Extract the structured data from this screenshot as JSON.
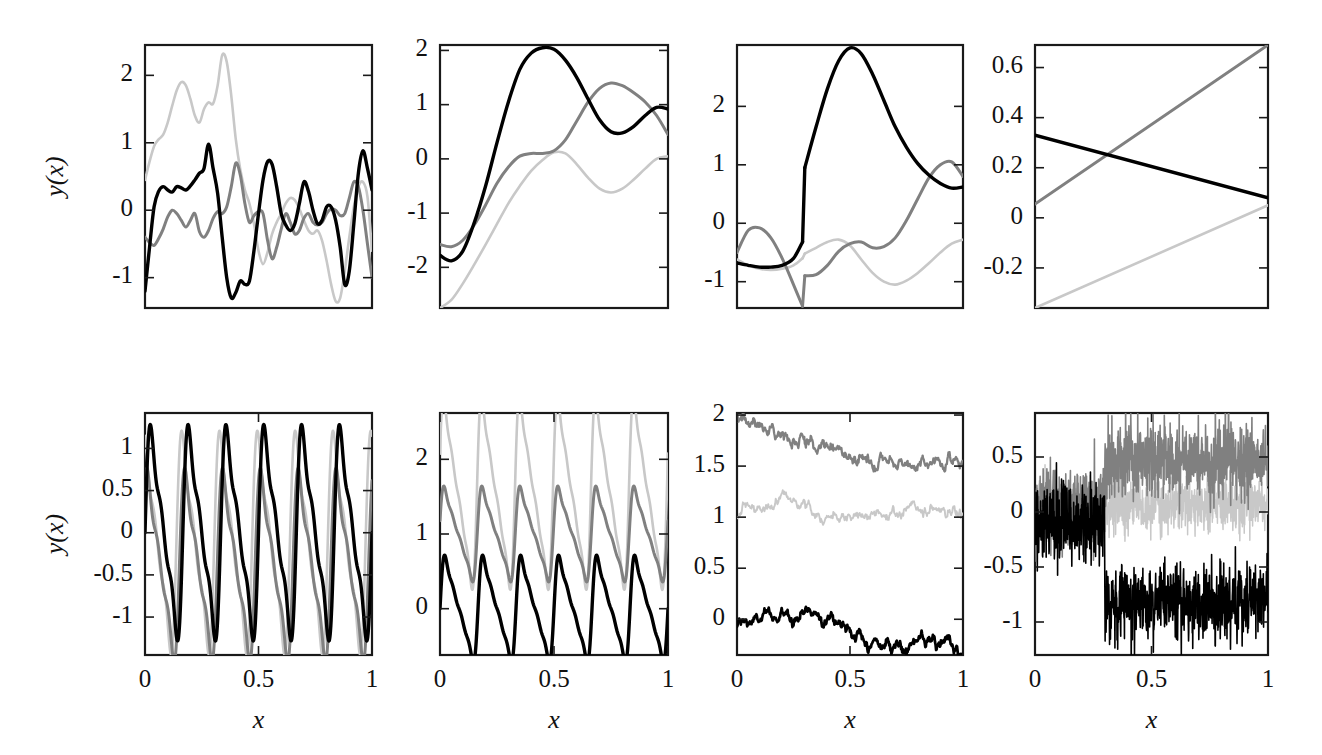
{
  "figure": {
    "width": 1322,
    "height": 755,
    "background": "#ffffff",
    "rows": 2,
    "cols": 4,
    "shared_ylabel": "y(x)",
    "shared_xlabel": "x"
  },
  "colors": {
    "series_1": "#000000",
    "series_2": "#808080",
    "series_3": "#c8c8c8",
    "frame": "#1a1a1a",
    "text": "#111111"
  },
  "chart_data": [
    {
      "id": "panel-1",
      "type": "line",
      "title": "",
      "xlabel": "",
      "ylabel": "y(x)",
      "xlim": [
        0,
        1
      ],
      "ylim": [
        -1.45,
        2.45
      ],
      "xticks": [],
      "xticklabels": [],
      "yticks": [
        -1,
        0,
        1,
        2
      ],
      "yticklabels": [
        "-1",
        "0",
        "1",
        "2"
      ],
      "grid": false,
      "legend": "none",
      "series": [
        {
          "name": "series_1",
          "color": "#000000",
          "x": [
            0.0,
            0.02,
            0.04,
            0.06,
            0.08,
            0.1,
            0.12,
            0.14,
            0.16,
            0.18,
            0.2,
            0.22,
            0.24,
            0.26,
            0.28,
            0.3,
            0.32,
            0.34,
            0.36,
            0.38,
            0.4,
            0.42,
            0.44,
            0.46,
            0.48,
            0.5,
            0.52,
            0.54,
            0.56,
            0.58,
            0.6,
            0.62,
            0.64,
            0.66,
            0.68,
            0.7,
            0.72,
            0.74,
            0.76,
            0.78,
            0.8,
            0.82,
            0.84,
            0.86,
            0.88,
            0.9,
            0.92,
            0.94,
            0.96,
            0.98,
            1.0
          ],
          "y": [
            -1.2,
            -0.55,
            0.05,
            0.28,
            0.35,
            0.3,
            0.27,
            0.35,
            0.33,
            0.3,
            0.36,
            0.45,
            0.55,
            0.62,
            0.98,
            0.62,
            0.25,
            -0.4,
            -1.0,
            -1.3,
            -1.22,
            -1.05,
            -1.1,
            -1.05,
            -0.6,
            -0.05,
            0.45,
            0.72,
            0.68,
            0.35,
            -0.05,
            -0.22,
            -0.3,
            -0.2,
            0.1,
            0.42,
            0.28,
            0.0,
            -0.2,
            -0.15,
            0.05,
            0.05,
            -0.15,
            -0.55,
            -1.1,
            -0.9,
            -0.2,
            0.55,
            0.88,
            0.62,
            0.3
          ]
        },
        {
          "name": "series_2",
          "color": "#808080",
          "x": [
            0.0,
            0.02,
            0.04,
            0.06,
            0.08,
            0.1,
            0.12,
            0.14,
            0.16,
            0.18,
            0.2,
            0.22,
            0.24,
            0.26,
            0.28,
            0.3,
            0.32,
            0.34,
            0.36,
            0.38,
            0.4,
            0.42,
            0.44,
            0.46,
            0.48,
            0.5,
            0.52,
            0.54,
            0.56,
            0.58,
            0.6,
            0.62,
            0.64,
            0.66,
            0.68,
            0.7,
            0.72,
            0.74,
            0.76,
            0.78,
            0.8,
            0.82,
            0.84,
            0.86,
            0.88,
            0.9,
            0.92,
            0.94,
            0.96,
            0.98,
            1.0
          ],
          "y": [
            -0.4,
            -0.48,
            -0.52,
            -0.42,
            -0.28,
            -0.1,
            0.0,
            -0.05,
            -0.15,
            -0.25,
            -0.15,
            -0.05,
            -0.32,
            -0.4,
            -0.3,
            -0.12,
            -0.02,
            -0.05,
            0.05,
            0.35,
            0.7,
            0.52,
            0.1,
            -0.18,
            -0.08,
            -0.02,
            -0.05,
            -0.45,
            -0.72,
            -0.55,
            -0.28,
            -0.05,
            -0.18,
            -0.35,
            -0.3,
            -0.12,
            -0.05,
            -0.18,
            -0.22,
            -0.18,
            -0.05,
            0.02,
            0.0,
            -0.08,
            -0.05,
            0.18,
            0.42,
            0.35,
            0.0,
            -0.5,
            -1.0
          ]
        },
        {
          "name": "series_3",
          "color": "#c8c8c8",
          "x": [
            0.0,
            0.02,
            0.04,
            0.06,
            0.08,
            0.1,
            0.12,
            0.14,
            0.16,
            0.18,
            0.2,
            0.22,
            0.24,
            0.26,
            0.28,
            0.3,
            0.32,
            0.34,
            0.36,
            0.38,
            0.4,
            0.42,
            0.44,
            0.46,
            0.48,
            0.5,
            0.52,
            0.54,
            0.56,
            0.58,
            0.6,
            0.62,
            0.64,
            0.66,
            0.68,
            0.7,
            0.72,
            0.74,
            0.76,
            0.78,
            0.8,
            0.82,
            0.84,
            0.86,
            0.88,
            0.9,
            0.92,
            0.94,
            0.96,
            0.98,
            1.0
          ],
          "y": [
            0.45,
            0.72,
            0.95,
            1.05,
            1.12,
            1.3,
            1.55,
            1.78,
            1.9,
            1.85,
            1.65,
            1.4,
            1.3,
            1.5,
            1.6,
            1.58,
            1.85,
            2.3,
            2.2,
            1.7,
            1.05,
            0.6,
            0.3,
            0.1,
            -0.2,
            -0.6,
            -0.8,
            -0.62,
            -0.35,
            -0.18,
            -0.05,
            0.1,
            0.18,
            0.15,
            0.02,
            -0.15,
            -0.3,
            -0.35,
            -0.3,
            -0.45,
            -0.75,
            -1.1,
            -1.35,
            -1.3,
            -0.9,
            -0.4,
            0.05,
            0.35,
            0.42,
            0.2,
            -0.6
          ]
        }
      ]
    },
    {
      "id": "panel-2",
      "type": "line",
      "title": "",
      "xlabel": "",
      "ylabel": "",
      "xlim": [
        0,
        1
      ],
      "ylim": [
        -2.75,
        2.1
      ],
      "xticks": [],
      "xticklabels": [],
      "yticks": [
        -2,
        -1,
        0,
        1,
        2
      ],
      "yticklabels": [
        "-2",
        "-1",
        "0",
        "1",
        "2"
      ],
      "grid": false,
      "legend": "none",
      "series": [
        {
          "name": "series_1",
          "color": "#000000",
          "x": [
            0.0,
            0.05,
            0.1,
            0.15,
            0.2,
            0.25,
            0.3,
            0.35,
            0.4,
            0.45,
            0.5,
            0.55,
            0.6,
            0.65,
            0.7,
            0.75,
            0.8,
            0.85,
            0.9,
            0.95,
            1.0
          ],
          "y": [
            -1.78,
            -1.88,
            -1.7,
            -1.18,
            -0.5,
            0.3,
            1.05,
            1.65,
            1.95,
            2.05,
            2.02,
            1.82,
            1.5,
            1.1,
            0.72,
            0.5,
            0.48,
            0.6,
            0.8,
            0.95,
            0.92
          ]
        },
        {
          "name": "series_2",
          "color": "#808080",
          "x": [
            0.0,
            0.05,
            0.1,
            0.15,
            0.2,
            0.25,
            0.3,
            0.35,
            0.4,
            0.45,
            0.5,
            0.55,
            0.6,
            0.65,
            0.7,
            0.75,
            0.8,
            0.85,
            0.9,
            0.95,
            1.0
          ],
          "y": [
            -1.58,
            -1.62,
            -1.5,
            -1.22,
            -0.85,
            -0.45,
            -0.15,
            0.05,
            0.1,
            0.1,
            0.15,
            0.35,
            0.7,
            1.05,
            1.3,
            1.4,
            1.35,
            1.22,
            1.05,
            0.8,
            0.45
          ]
        },
        {
          "name": "series_3",
          "color": "#c8c8c8",
          "x": [
            0.0,
            0.05,
            0.1,
            0.15,
            0.2,
            0.25,
            0.3,
            0.35,
            0.4,
            0.45,
            0.5,
            0.55,
            0.6,
            0.65,
            0.7,
            0.75,
            0.8,
            0.85,
            0.9,
            0.95,
            1.0
          ],
          "y": [
            -2.75,
            -2.6,
            -2.3,
            -1.95,
            -1.58,
            -1.2,
            -0.82,
            -0.5,
            -0.22,
            -0.02,
            0.12,
            0.1,
            -0.1,
            -0.35,
            -0.55,
            -0.62,
            -0.55,
            -0.38,
            -0.18,
            0.0,
            0.05
          ]
        }
      ]
    },
    {
      "id": "panel-3",
      "type": "line",
      "title": "",
      "xlabel": "",
      "ylabel": "",
      "xlim": [
        0,
        1
      ],
      "ylim": [
        -1.45,
        3.05
      ],
      "xticks": [],
      "xticklabels": [],
      "yticks": [
        -1,
        0,
        1,
        2
      ],
      "yticklabels": [
        "-1",
        "0",
        "1",
        "2"
      ],
      "grid": false,
      "legend": "none",
      "discontinuity_x": 0.3,
      "series": [
        {
          "name": "series_1",
          "color": "#000000",
          "x": [
            0.0,
            0.05,
            0.1,
            0.15,
            0.2,
            0.25,
            0.29,
            0.3,
            0.35,
            0.4,
            0.45,
            0.5,
            0.55,
            0.6,
            0.65,
            0.7,
            0.75,
            0.8,
            0.85,
            0.9,
            0.95,
            1.0
          ],
          "y": [
            -0.68,
            -0.72,
            -0.75,
            -0.75,
            -0.72,
            -0.6,
            -0.32,
            0.95,
            1.65,
            2.3,
            2.78,
            3.0,
            2.9,
            2.55,
            2.1,
            1.65,
            1.3,
            1.02,
            0.82,
            0.68,
            0.6,
            0.62
          ]
        },
        {
          "name": "series_2",
          "color": "#808080",
          "x": [
            0.0,
            0.05,
            0.1,
            0.15,
            0.2,
            0.25,
            0.29,
            0.3,
            0.35,
            0.4,
            0.45,
            0.5,
            0.55,
            0.6,
            0.65,
            0.7,
            0.75,
            0.8,
            0.85,
            0.9,
            0.95,
            1.0
          ],
          "y": [
            -0.5,
            -0.12,
            -0.08,
            -0.25,
            -0.6,
            -1.05,
            -1.42,
            -0.9,
            -0.88,
            -0.72,
            -0.48,
            -0.35,
            -0.32,
            -0.42,
            -0.4,
            -0.25,
            0.05,
            0.42,
            0.78,
            1.0,
            1.05,
            0.8
          ]
        },
        {
          "name": "series_3",
          "color": "#c8c8c8",
          "x": [
            0.0,
            0.05,
            0.1,
            0.15,
            0.2,
            0.25,
            0.29,
            0.3,
            0.35,
            0.4,
            0.45,
            0.5,
            0.55,
            0.6,
            0.65,
            0.7,
            0.75,
            0.8,
            0.85,
            0.9,
            0.95,
            1.0
          ],
          "y": [
            -0.62,
            -0.72,
            -0.78,
            -0.8,
            -0.78,
            -0.72,
            -0.6,
            -0.52,
            -0.42,
            -0.32,
            -0.28,
            -0.38,
            -0.62,
            -0.85,
            -1.0,
            -1.05,
            -0.98,
            -0.85,
            -0.68,
            -0.5,
            -0.35,
            -0.28
          ]
        }
      ]
    },
    {
      "id": "panel-4",
      "type": "line",
      "title": "",
      "xlabel": "",
      "ylabel": "",
      "xlim": [
        0,
        1
      ],
      "ylim": [
        -0.36,
        0.69
      ],
      "xticks": [],
      "xticklabels": [],
      "yticks": [
        -0.2,
        0,
        0.2,
        0.4,
        0.6
      ],
      "yticklabels": [
        "-0.2",
        "0",
        "0.2",
        "0.4",
        "0.6"
      ],
      "grid": false,
      "legend": "none",
      "series": [
        {
          "name": "series_1",
          "color": "#000000",
          "x": [
            0.0,
            1.0
          ],
          "y": [
            0.33,
            0.08
          ]
        },
        {
          "name": "series_2",
          "color": "#808080",
          "x": [
            0.0,
            1.0
          ],
          "y": [
            0.055,
            0.69
          ]
        },
        {
          "name": "series_3",
          "color": "#c8c8c8",
          "x": [
            0.0,
            1.0
          ],
          "y": [
            -0.36,
            0.05
          ]
        }
      ]
    },
    {
      "id": "panel-5",
      "type": "line",
      "title": "",
      "xlabel": "x",
      "ylabel": "y(x)",
      "xlim": [
        0,
        1
      ],
      "ylim": [
        -1.45,
        1.42
      ],
      "xticks": [
        0,
        0.5,
        1
      ],
      "xticklabels": [
        "0",
        "0.5",
        "1"
      ],
      "yticks": [
        -1,
        -0.5,
        0,
        0.5,
        1
      ],
      "yticklabels": [
        "-1",
        "-0.5",
        "0",
        "0.5",
        "1"
      ],
      "grid": false,
      "legend": "none",
      "periods": 6,
      "series": [
        {
          "name": "series_1",
          "color": "#000000",
          "amplitude": 1.4,
          "offset": 0.0,
          "phase": 0.0
        },
        {
          "name": "series_2",
          "color": "#808080",
          "amplitude": 1.25,
          "offset": -0.38,
          "phase": 0.09
        },
        {
          "name": "series_3",
          "color": "#c8c8c8",
          "amplitude": 1.45,
          "offset": -0.12,
          "phase": 0.17
        }
      ]
    },
    {
      "id": "panel-6",
      "type": "line",
      "title": "",
      "xlabel": "x",
      "ylabel": "",
      "xlim": [
        0,
        1
      ],
      "ylim": [
        -0.62,
        2.62
      ],
      "xticks": [
        0,
        0.5,
        1
      ],
      "xticklabels": [
        "0",
        "0.5",
        "1"
      ],
      "yticks": [
        0,
        1,
        2
      ],
      "yticklabels": [
        "0",
        "1",
        "2"
      ],
      "grid": false,
      "legend": "none",
      "periods": 6,
      "series": [
        {
          "name": "series_1",
          "color": "#000000",
          "amplitude": 0.58,
          "offset": 0.0,
          "phase": 0.0
        },
        {
          "name": "series_2",
          "color": "#808080",
          "amplitude": 0.52,
          "offset": 1.0,
          "phase": 0.02
        },
        {
          "name": "series_3",
          "color": "#c8c8c8",
          "amplitude": 1.05,
          "offset": 1.55,
          "phase": 0.03
        }
      ]
    },
    {
      "id": "panel-7",
      "type": "line",
      "title": "",
      "xlabel": "x",
      "ylabel": "",
      "xlim": [
        0,
        1
      ],
      "ylim": [
        -0.35,
        2.02
      ],
      "xticks": [
        0,
        0.5,
        1
      ],
      "xticklabels": [
        "0",
        "0.5",
        "1"
      ],
      "yticks": [
        0,
        0.5,
        1,
        1.5,
        2
      ],
      "yticklabels": [
        "0",
        "0.5",
        "1",
        "1.5",
        "2"
      ],
      "grid": false,
      "legend": "none",
      "description": "brownian-paths",
      "series": [
        {
          "name": "series_1",
          "color": "#000000",
          "start": -0.06,
          "trend": [
            -0.06,
            0.0,
            0.04,
            0.09,
            0.0,
            -0.2,
            -0.26,
            -0.22,
            -0.26,
            -0.3
          ],
          "noise": 0.022
        },
        {
          "name": "series_2",
          "color": "#808080",
          "start": 2.0,
          "trend": [
            2.0,
            1.88,
            1.8,
            1.75,
            1.66,
            1.52,
            1.55,
            1.5,
            1.55,
            1.57
          ],
          "noise": 0.022
        },
        {
          "name": "series_3",
          "color": "#c8c8c8",
          "start": 1.0,
          "trend": [
            1.0,
            1.12,
            1.22,
            1.05,
            1.0,
            1.02,
            1.0,
            1.1,
            1.06,
            1.0
          ],
          "noise": 0.02
        }
      ]
    },
    {
      "id": "panel-8",
      "type": "line",
      "title": "",
      "xlabel": "x",
      "ylabel": "",
      "xlim": [
        0,
        1
      ],
      "ylim": [
        -1.3,
        0.9
      ],
      "xticks": [
        0,
        0.5,
        1
      ],
      "xticklabels": [
        "0",
        "0.5",
        "1"
      ],
      "yticks": [
        -1,
        -0.5,
        0,
        0.5
      ],
      "yticklabels": [
        "-1",
        "-0.5",
        "0",
        "0.5"
      ],
      "grid": false,
      "legend": "none",
      "description": "noisy-signals-with-level-shift",
      "change_point_x": 0.3,
      "series": [
        {
          "name": "series_1",
          "color": "#000000",
          "level_before": -0.1,
          "level_after": -0.82,
          "noise_before": 0.17,
          "noise_after": 0.17
        },
        {
          "name": "series_2",
          "color": "#808080",
          "level_before": 0.05,
          "level_after": 0.45,
          "noise_before": 0.16,
          "noise_after": 0.17
        },
        {
          "name": "series_3",
          "color": "#c8c8c8",
          "level_before": 0.03,
          "level_after": 0.07,
          "noise_before": 0.14,
          "noise_after": 0.13
        }
      ]
    }
  ]
}
